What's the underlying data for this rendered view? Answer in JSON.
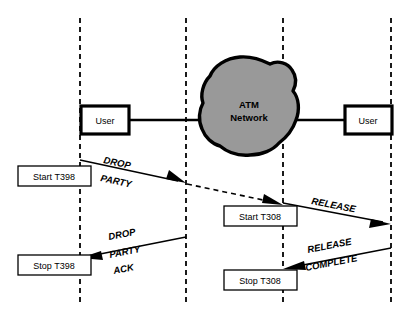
{
  "diagram": {
    "colors": {
      "background": "#ffffff",
      "line": "#000000",
      "lifeline": "#1a1a1a",
      "cloud_fill": "#999999",
      "box_fill": "#ffffff"
    },
    "nodes": {
      "user_left": {
        "label": "User"
      },
      "user_right": {
        "label": "User"
      },
      "network": {
        "label_line1": "ATM",
        "label_line2": "Network"
      }
    },
    "timer_boxes": [
      {
        "id": "start-t398",
        "label": "Start T398"
      },
      {
        "id": "stop-t398",
        "label": "Stop T398"
      },
      {
        "id": "start-t308",
        "label": "Start T308"
      },
      {
        "id": "stop-t308",
        "label": "Stop T308"
      }
    ],
    "messages": [
      {
        "id": "drop-party",
        "lines": [
          "DROP",
          "PARTY"
        ],
        "direction": "left-to-right",
        "style": "solid"
      },
      {
        "id": "network-transit",
        "lines": [],
        "direction": "left-to-right",
        "style": "dashed"
      },
      {
        "id": "release",
        "lines": [
          "RELEASE"
        ],
        "direction": "left-to-right",
        "style": "solid"
      },
      {
        "id": "drop-party-ack",
        "lines": [
          "DROP",
          "PARTY",
          "ACK"
        ],
        "direction": "right-to-left",
        "style": "solid"
      },
      {
        "id": "release-complete",
        "lines": [
          "RELEASE",
          "COMPLETE"
        ],
        "direction": "right-to-left",
        "style": "solid"
      }
    ],
    "lifelines": [
      {
        "id": "lifeline-1",
        "x": 80
      },
      {
        "id": "lifeline-2",
        "x": 186
      },
      {
        "id": "lifeline-3",
        "x": 283
      },
      {
        "id": "lifeline-4",
        "x": 391
      }
    ]
  }
}
